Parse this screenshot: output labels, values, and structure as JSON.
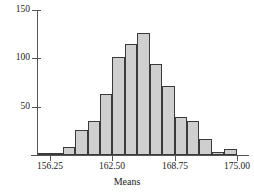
{
  "chart_data": {
    "type": "bar",
    "title": "",
    "subtitle": "",
    "xlabel": "Means",
    "ylabel": "",
    "grid": false,
    "legend": null,
    "xlim": [
      155.0,
      176.25
    ],
    "ylim": [
      0,
      150
    ],
    "bin_width": 1.25,
    "x_tick_labels": [
      "156.25",
      "162.50",
      "168.75",
      "175.00"
    ],
    "x_tick_values": [
      156.25,
      162.5,
      168.75,
      175.0
    ],
    "y_tick_labels": [
      "50",
      "100",
      "150"
    ],
    "y_tick_values": [
      50,
      100,
      150
    ],
    "bin_starts": [
      155.0,
      156.25,
      157.5,
      158.75,
      160.0,
      161.25,
      162.5,
      163.75,
      165.0,
      166.25,
      167.5,
      168.75,
      170.0,
      171.25,
      172.5,
      173.75,
      175.0
    ],
    "bin_centers": [
      155.625,
      156.875,
      158.125,
      159.375,
      160.625,
      161.875,
      163.125,
      164.375,
      165.625,
      166.875,
      168.125,
      169.375,
      170.625,
      171.875,
      173.125,
      174.375,
      175.625
    ],
    "categories": [
      "155.00-156.25",
      "156.25-157.50",
      "157.50-158.75",
      "158.75-160.00",
      "160.00-161.25",
      "161.25-162.50",
      "162.50-163.75",
      "163.75-165.00",
      "165.00-166.25",
      "166.25-167.50",
      "167.50-168.75",
      "168.75-170.00",
      "170.00-171.25",
      "171.25-172.50",
      "172.50-173.75",
      "173.75-175.00",
      "175.00-176.25"
    ],
    "values": [
      1,
      1,
      8,
      26,
      35,
      63,
      101,
      115,
      126,
      94,
      71,
      39,
      35,
      17,
      3,
      6,
      0
    ],
    "colors": {
      "bar_fill": "#cfcfcf",
      "bar_border": "#3a3a3a",
      "axis": "#555555",
      "text": "#1a1a1a",
      "background": "#ffffff"
    }
  },
  "axes": {
    "x_title": "Means",
    "y_title": ""
  }
}
